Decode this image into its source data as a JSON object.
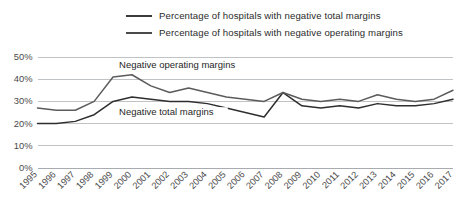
{
  "legend": {
    "position": "top",
    "items": [
      {
        "label": "Percentage of hospitals with negative total margins",
        "color": "#2e2e2e",
        "series": "total"
      },
      {
        "label": "Percentage of hospitals with negative operating margins",
        "color": "#5b5b5b",
        "series": "operating"
      }
    ]
  },
  "annotations": [
    {
      "text": "Negative operating margins",
      "x": 1999,
      "y": 45
    },
    {
      "text": "Negative total margins",
      "x": 1999,
      "y": 24
    }
  ],
  "axes": {
    "y_ticks": [
      "0%",
      "10%",
      "20%",
      "30%",
      "40%",
      "50%"
    ],
    "x_ticks": [
      "1995",
      "1996",
      "1997",
      "1998",
      "1999",
      "2000",
      "2001",
      "2002",
      "2003",
      "2004",
      "2005",
      "2006",
      "2007",
      "2008",
      "2009",
      "2010",
      "2011",
      "2012",
      "2013",
      "2014",
      "2015",
      "2016",
      "2017"
    ]
  },
  "chart_data": {
    "type": "line",
    "title": "",
    "subtitle": "",
    "xlabel": "",
    "ylabel": "",
    "ylim": [
      0,
      50
    ],
    "ytick_values": [
      0,
      10,
      20,
      30,
      40,
      50
    ],
    "ytick_labels": [
      "0%",
      "10%",
      "20%",
      "30%",
      "40%",
      "50%"
    ],
    "grid": true,
    "grid_axis": "y",
    "legend_position": "top",
    "x": [
      1995,
      1996,
      1997,
      1998,
      1999,
      2000,
      2001,
      2002,
      2003,
      2004,
      2005,
      2006,
      2007,
      2008,
      2009,
      2010,
      2011,
      2012,
      2013,
      2014,
      2015,
      2016,
      2017
    ],
    "xtick_labels": [
      "1995",
      "1996",
      "1997",
      "1998",
      "1999",
      "2000",
      "2001",
      "2002",
      "2003",
      "2004",
      "2005",
      "2006",
      "2007",
      "2008",
      "2009",
      "2010",
      "2011",
      "2012",
      "2013",
      "2014",
      "2015",
      "2016",
      "2017"
    ],
    "series": [
      {
        "name": "Percentage of hospitals with negative total margins",
        "key": "total",
        "color": "#2e2e2e",
        "values": [
          20,
          20,
          21,
          24,
          30,
          32,
          31,
          30,
          30,
          29,
          27,
          25,
          23,
          34,
          28,
          27,
          28,
          27,
          29,
          28,
          28,
          29,
          31
        ]
      },
      {
        "name": "Percentage of hospitals with negative operating margins",
        "key": "operating",
        "color": "#5b5b5b",
        "values": [
          27,
          26,
          26,
          30,
          41,
          42,
          37,
          34,
          36,
          34,
          32,
          31,
          30,
          34,
          31,
          30,
          31,
          30,
          33,
          31,
          30,
          31,
          35
        ]
      }
    ],
    "annotations": [
      {
        "text": "Negative operating margins",
        "x": 1999,
        "y": 45
      },
      {
        "text": "Negative total margins",
        "x": 1999,
        "y": 24
      }
    ]
  }
}
